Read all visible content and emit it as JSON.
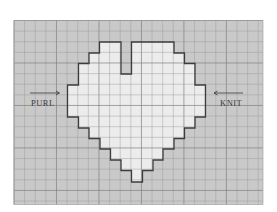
{
  "diagram": {
    "title": "",
    "type": "knitting-chart",
    "grid": {
      "x": 14,
      "y": 20.5,
      "width": 249,
      "height": 184,
      "cell": 10.62,
      "background_color": "#c9c9c9",
      "line_color": "#9a9a9a",
      "major_line_color": "#808080"
    },
    "heart": {
      "fill_color": "#ececec",
      "outline_color": "#3c3c3c",
      "points": "99.5,42 121,42 121,74 131.5,74 131.5,42 174,42 174,53 184.5,53 184.5,63.5 195,63.5 195,85 205.5,85 205.5,117 195,117 195,128 184.5,128 184.5,138.5 174,138.5 174,149 163,149 163,160 153,160 153,170.5 142.5,170.5 142.5,182 131.5,182 131.5,170.5 121,170.5 121,160 110.5,160 110.5,149 100,149 100,138.5 89,138.5 89,128 78.5,128 78.5,117 67.5,117 67.5,85 78.5,85 78.5,63.5 89,63.5 89,53 99.5,53"
    },
    "labels": {
      "left": {
        "text": "PURL",
        "arrow": "right-arrow"
      },
      "right": {
        "text": "KNIT",
        "arrow": "left-arrow"
      }
    }
  }
}
